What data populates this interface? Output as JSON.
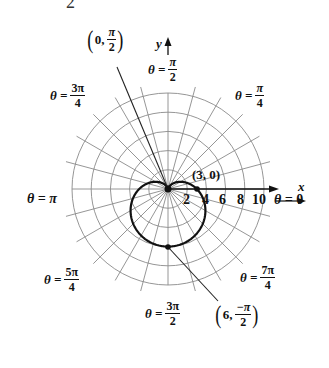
{
  "chart_data": {
    "type": "line",
    "coordinate_system": "polar",
    "title": "",
    "equation": "r = 3 - 3 sin θ",
    "xlabel": "x",
    "ylabel": "y",
    "radial_ticks": [
      2,
      4,
      6,
      8,
      10
    ],
    "radial_tick_labels": [
      "2",
      "4",
      "6",
      "8",
      "10"
    ],
    "rlim": [
      0,
      10
    ],
    "angle_grid_step": "π/12",
    "grid": true,
    "angle_labels": [
      {
        "theta": "0",
        "label_lhs": "θ =",
        "label_value": "0"
      },
      {
        "theta": "π/4",
        "label_lhs": "θ =",
        "num": "π",
        "den": "4"
      },
      {
        "theta": "π/2",
        "label_lhs": "θ =",
        "num": "π",
        "den": "2"
      },
      {
        "theta": "3π/4",
        "label_lhs": "θ =",
        "num": "3π",
        "den": "4"
      },
      {
        "theta": "π",
        "label_lhs": "θ =",
        "label_value": "π"
      },
      {
        "theta": "5π/4",
        "label_lhs": "θ =",
        "num": "5π",
        "den": "4"
      },
      {
        "theta": "3π/2",
        "label_lhs": "θ =",
        "num": "3π",
        "den": "2"
      },
      {
        "theta": "7π/4",
        "label_lhs": "θ =",
        "num": "7π",
        "den": "4"
      }
    ],
    "annotated_points": [
      {
        "label": "(3, 0)",
        "r": 3,
        "theta": "0"
      },
      {
        "label_r": "0",
        "num": "π",
        "den": "2",
        "r": 0,
        "theta": "π/2"
      },
      {
        "label_r": "6",
        "num": "−π",
        "den": "2",
        "r": 6,
        "theta": "−π/2"
      }
    ],
    "series": [
      {
        "name": "cardioid",
        "theta_deg": [
          0,
          30,
          60,
          90,
          120,
          150,
          180,
          210,
          240,
          270,
          300,
          330,
          360
        ],
        "r": [
          3,
          1.5,
          0.4,
          0,
          0.4,
          1.5,
          3,
          4.5,
          5.6,
          6,
          5.6,
          4.5,
          3
        ]
      }
    ]
  },
  "labels": {
    "top_partial": "2",
    "y_axis": "y",
    "x_axis": "x",
    "theta_eq": "θ =",
    "theta_0_value": "0",
    "theta_pi_value": "π",
    "pi_4": {
      "num": "π",
      "den": "4"
    },
    "pi_2": {
      "num": "π",
      "den": "2"
    },
    "three_pi_4": {
      "num": "3π",
      "den": "4"
    },
    "five_pi_4": {
      "num": "5π",
      "den": "4"
    },
    "three_pi_2": {
      "num": "3π",
      "den": "2"
    },
    "seven_pi_4": {
      "num": "7π",
      "den": "4"
    },
    "point_3_0": "(3, 0)",
    "point_0_pi2": {
      "r": "0,",
      "num": "π",
      "den": "2"
    },
    "point_6_negpi2": {
      "r": "6,",
      "num": "−π",
      "den": "2"
    },
    "open_paren": "(",
    "close_paren": ")",
    "tick_2": "2",
    "tick_4": "4",
    "tick_6": "6",
    "tick_8": "8",
    "tick_10": "10"
  },
  "colors": {
    "grid": "#8a8a8a",
    "curve": "#111111",
    "axis": "#111111",
    "background": "#ffffff"
  }
}
